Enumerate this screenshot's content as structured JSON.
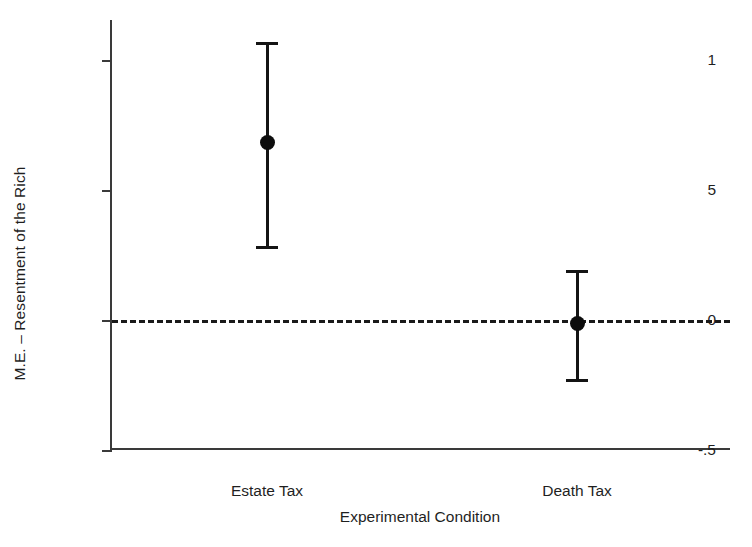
{
  "chart_data": {
    "type": "scatter",
    "title": "",
    "xlabel": "Experimental Condition",
    "ylabel": "M.E. – Resentment of the Rich",
    "categories": [
      "Estate Tax",
      "Death Tax"
    ],
    "ytick_labels": [
      "1",
      "5",
      "0",
      "-.5"
    ],
    "ytick_values": [
      1,
      0.5,
      0,
      -0.5
    ],
    "ylim": [
      -0.5,
      1.155
    ],
    "grid": false,
    "legend": null,
    "reference_line": {
      "value": 0,
      "style": "dashed",
      "color": "#1a1a1a"
    },
    "series": [
      {
        "name": "Marginal Effect",
        "marker": "filled-circle",
        "color": "#0d0d0d",
        "points": [
          {
            "x": "Estate Tax",
            "value": 0.685,
            "ci_low": 0.285,
            "ci_high": 1.07
          },
          {
            "x": "Death Tax",
            "value": -0.015,
            "ci_low": -0.228,
            "ci_high": 0.194
          }
        ]
      }
    ]
  },
  "axis": {
    "y_title": "M.E. – Resentment of the Rich",
    "x_title": "Experimental Condition",
    "y_ticks": [
      {
        "label": "1",
        "value": 1
      },
      {
        "label": "5",
        "value": 0.5
      },
      {
        "label": "0",
        "value": 0
      },
      {
        "label": "-.5",
        "value": -0.5
      }
    ],
    "x_ticks": [
      {
        "label": "Estate Tax"
      },
      {
        "label": "Death Tax"
      }
    ]
  }
}
